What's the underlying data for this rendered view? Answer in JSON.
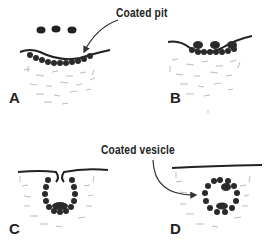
{
  "diagram": {
    "callouts": {
      "coated_pit": "Coated pit",
      "coated_vesicle": "Coated vesicle"
    },
    "panels": [
      {
        "label": "A",
        "stage": "Particles above membrane with coated region"
      },
      {
        "label": "B",
        "stage": "Particles bound to coated pit"
      },
      {
        "label": "C",
        "stage": "Invaginating coated pit"
      },
      {
        "label": "D",
        "stage": "Internalized coated vesicle"
      }
    ],
    "colors": {
      "ink": "#222222",
      "texture": "#9a9a9a",
      "background": "#ffffff"
    }
  }
}
